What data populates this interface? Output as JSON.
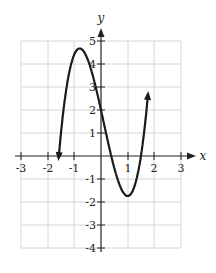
{
  "chart_data": {
    "type": "line",
    "title": "",
    "xlabel": "x",
    "ylabel": "y",
    "xlim": [
      -3,
      3
    ],
    "ylim": [
      -4,
      5
    ],
    "grid": true,
    "x_ticks": [
      "-3",
      "-2",
      "-1",
      "1",
      "2",
      "3"
    ],
    "y_ticks": [
      "5",
      "4",
      "3",
      "2",
      "1",
      "-1",
      "-2",
      "-3",
      "-4"
    ],
    "series": [
      {
        "name": "cubic polynomial",
        "description": "Cubic curve with arrows at both ends; local maximum near (-0.8, 4.7), local minimum at (1, -2), y-intercept 2",
        "x": [
          -1.6,
          -1.45,
          -1.2,
          -1.0,
          -0.8,
          -0.5,
          0.0,
          0.4,
          0.5,
          1.0,
          1.5,
          1.6,
          1.75
        ],
        "y": [
          -4.5,
          0.0,
          3.5,
          4.6,
          4.7,
          4.1,
          2.0,
          0.0,
          -0.6,
          -2.0,
          -0.2,
          0.6,
          5.5
        ],
        "local_max": [
          -0.8,
          4.7
        ],
        "local_min": [
          1,
          -2
        ],
        "y_intercept": 2
      }
    ]
  },
  "axes": {
    "x_label": "x",
    "y_label": "y"
  }
}
